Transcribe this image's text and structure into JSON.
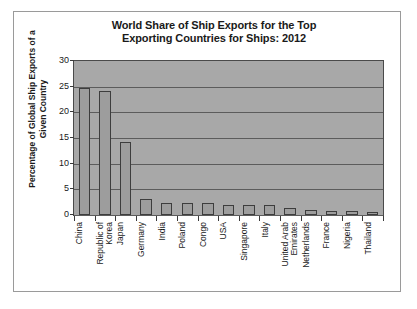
{
  "chart_data": {
    "type": "bar",
    "title": "World Share of Ship Exports for the Top Exporting Countries for Ships: 2012",
    "title_line1": "World Share of Ship Exports for the Top",
    "title_line2": "Exporting Countries for Ships: 2012",
    "xlabel": "",
    "ylabel": "Percentage of Global Ship Exports of a Given Country",
    "ylabel_line1": "Percentage of Global Ship Exports of a",
    "ylabel_line2": "Given Country",
    "ylim": [
      0,
      30
    ],
    "ytick_labels": [
      "30",
      "25",
      "20",
      "15",
      "10",
      "5",
      "0"
    ],
    "ytick_values": [
      30,
      25,
      20,
      15,
      10,
      5,
      0
    ],
    "grid": true,
    "legend": false,
    "categories": [
      "China",
      "Republic of Korea",
      "Japan",
      "Germany",
      "India",
      "Poland",
      "Congo",
      "USA",
      "Singapore",
      "Italy",
      "United Arab Emirates",
      "Netherlands",
      "France",
      "Nigeria",
      "Thailand"
    ],
    "category_lines": [
      [
        "China"
      ],
      [
        "Republic of",
        "Korea"
      ],
      [
        "Japan"
      ],
      [
        "Germany"
      ],
      [
        "India"
      ],
      [
        "Poland"
      ],
      [
        "Congo"
      ],
      [
        "USA"
      ],
      [
        "Singapore"
      ],
      [
        "Italy"
      ],
      [
        "United Arab",
        "Emirates"
      ],
      [
        "Netherlands"
      ],
      [
        "France"
      ],
      [
        "Nigeria"
      ],
      [
        "Thailand"
      ]
    ],
    "values": [
      24.8,
      24.1,
      14.2,
      3.1,
      2.4,
      2.3,
      2.3,
      1.9,
      1.9,
      1.9,
      1.3,
      0.9,
      0.7,
      0.7,
      0.6
    ],
    "colors": {
      "bar_fill": "#9d9d9d",
      "bar_border": "#3d3d3d",
      "plot_background": "#a8a8a8",
      "gridline": "#5c5c5c",
      "axis": "#4a4a4a",
      "text": "#1a1a1a",
      "figure_border": "#9a9a9a",
      "figure_background": "#ffffff"
    }
  }
}
